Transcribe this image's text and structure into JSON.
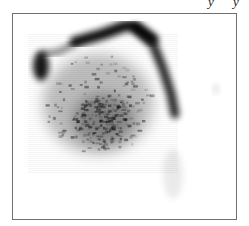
{
  "figure": {
    "fragments": [
      {
        "text": "y",
        "x": 208
      },
      {
        "text": "y",
        "x": 233
      }
    ]
  },
  "chart_data": {
    "type": "heatmap",
    "title": "",
    "xlabel": "",
    "ylabel": "",
    "colormap": "grayscale (white = low, black = high density)",
    "grid": false,
    "legend": null,
    "frame": {
      "x": 12,
      "y": 13,
      "width": 225,
      "height": 207,
      "color": "#6f6f6f"
    },
    "features": [
      {
        "name": "ridge-top",
        "shape": "band",
        "points": [
          [
            62,
            28
          ],
          [
            90,
            20
          ],
          [
            112,
            12
          ],
          [
            122,
            12
          ],
          [
            140,
            25
          ]
        ],
        "width": 11,
        "intensity": 0.95
      },
      {
        "name": "ridge-right",
        "shape": "band",
        "points": [
          [
            122,
            14
          ],
          [
            140,
            30
          ],
          [
            150,
            55
          ],
          [
            158,
            80
          ],
          [
            162,
            100
          ]
        ],
        "width": 9,
        "intensity": 0.85
      },
      {
        "name": "upper-left-patch",
        "shape": "blob",
        "cx": 28,
        "cy": 52,
        "rx": 8,
        "ry": 15,
        "intensity": 0.9
      },
      {
        "name": "left-arm",
        "shape": "band",
        "points": [
          [
            30,
            40
          ],
          [
            45,
            38
          ],
          [
            62,
            30
          ]
        ],
        "width": 6,
        "intensity": 0.5
      },
      {
        "name": "interior-cloud",
        "shape": "blob",
        "cx": 85,
        "cy": 90,
        "rx": 55,
        "ry": 50,
        "intensity": 0.25
      },
      {
        "name": "interior-core",
        "shape": "blob",
        "cx": 90,
        "cy": 105,
        "rx": 30,
        "ry": 25,
        "intensity": 0.3
      },
      {
        "name": "lower-tail",
        "shape": "blob",
        "cx": 160,
        "cy": 160,
        "rx": 10,
        "ry": 25,
        "intensity": 0.08
      },
      {
        "name": "right-speck",
        "shape": "blob",
        "cx": 203,
        "cy": 75,
        "rx": 3,
        "ry": 5,
        "intensity": 0.12
      }
    ]
  }
}
